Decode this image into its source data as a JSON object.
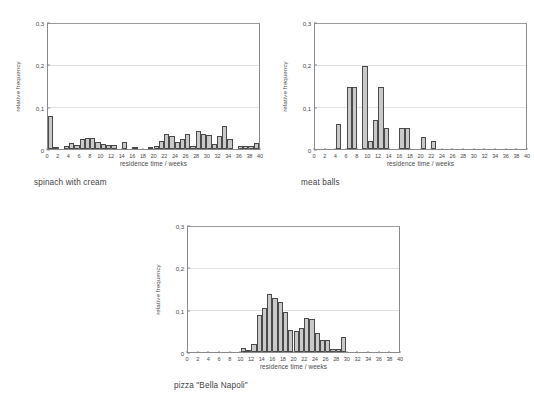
{
  "figure": {
    "background_color": "#ffffff",
    "bar_fill_color": "#c9c9c9",
    "bar_edge_color": "#4a4a4a",
    "axis_color": "#8a8a8a",
    "grid_color": "#e2e2e2",
    "text_color": "#3f3f3f"
  },
  "chart_data": [
    {
      "type": "bar",
      "id": "spinach-with-cream",
      "title": "spinach with cream",
      "caption": "spinach with cream",
      "xlabel": "residence time / weeks",
      "ylabel": "relative frequency",
      "xlim": [
        0,
        40
      ],
      "ylim": [
        0,
        0.3
      ],
      "bin_width": 1,
      "grid": true,
      "legend": "none",
      "ytick_labels": [
        "0",
        "0,1",
        "0,2",
        "0,3"
      ],
      "ytick_values": [
        0,
        0.1,
        0.2,
        0.3
      ],
      "xtick_labels": [
        "0",
        "2",
        "4",
        "6",
        "8",
        "10",
        "12",
        "14",
        "16",
        "18",
        "20",
        "22",
        "24",
        "26",
        "28",
        "30",
        "32",
        "34",
        "36",
        "38",
        "40"
      ],
      "xtick_values": [
        0,
        2,
        4,
        6,
        8,
        10,
        12,
        14,
        16,
        18,
        20,
        22,
        24,
        26,
        28,
        30,
        32,
        34,
        36,
        38,
        40
      ],
      "x": [
        0,
        1,
        2,
        3,
        4,
        5,
        6,
        7,
        8,
        9,
        10,
        11,
        12,
        13,
        14,
        15,
        16,
        17,
        18,
        19,
        20,
        21,
        22,
        23,
        24,
        25,
        26,
        27,
        28,
        29,
        30,
        31,
        32,
        33,
        34,
        35,
        36,
        37,
        38,
        39
      ],
      "values": [
        0.08,
        0.006,
        0.0,
        0.008,
        0.014,
        0.009,
        0.024,
        0.027,
        0.027,
        0.016,
        0.012,
        0.009,
        0.009,
        0.0,
        0.017,
        0.0,
        0.006,
        0.0,
        0.0,
        0.005,
        0.008,
        0.02,
        0.035,
        0.032,
        0.018,
        0.025,
        0.035,
        0.007,
        0.044,
        0.035,
        0.034,
        0.013,
        0.031,
        0.055,
        0.023,
        0.0,
        0.008,
        0.008,
        0.008,
        0.015
      ]
    },
    {
      "type": "bar",
      "id": "meat-balls",
      "title": "meat balls",
      "caption": "meat balls",
      "xlabel": "residence time / weeks",
      "ylabel": "relative frequency",
      "xlim": [
        0,
        40
      ],
      "ylim": [
        0,
        0.3
      ],
      "bin_width": 1,
      "grid": true,
      "legend": "none",
      "ytick_labels": [
        "0",
        "0,1",
        "0,2",
        "0,3"
      ],
      "ytick_values": [
        0,
        0.1,
        0.2,
        0.3
      ],
      "xtick_labels": [
        "0",
        "2",
        "4",
        "6",
        "8",
        "10",
        "12",
        "14",
        "16",
        "18",
        "20",
        "22",
        "24",
        "26",
        "28",
        "30",
        "32",
        "34",
        "36",
        "38",
        "40"
      ],
      "xtick_values": [
        0,
        2,
        4,
        6,
        8,
        10,
        12,
        14,
        16,
        18,
        20,
        22,
        24,
        26,
        28,
        30,
        32,
        34,
        36,
        38,
        40
      ],
      "x": [
        0,
        1,
        2,
        3,
        4,
        5,
        6,
        7,
        8,
        9,
        10,
        11,
        12,
        13,
        14,
        15,
        16,
        17,
        18,
        19,
        20,
        21,
        22,
        23,
        24,
        25,
        26,
        27,
        28,
        29,
        30,
        31,
        32,
        33,
        34,
        35,
        36,
        37,
        38,
        39
      ],
      "values": [
        0.0,
        0.0,
        0.0,
        0.0,
        0.06,
        0.0,
        0.15,
        0.15,
        0.0,
        0.2,
        0.02,
        0.07,
        0.15,
        0.05,
        0.0,
        0.0,
        0.05,
        0.05,
        0.0,
        0.0,
        0.03,
        0.0,
        0.02,
        0.0,
        0.0,
        0.0,
        0.0,
        0.0,
        0.0,
        0.0,
        0.0,
        0.0,
        0.0,
        0.0,
        0.0,
        0.0,
        0.0,
        0.0,
        0.0,
        0.0
      ]
    },
    {
      "type": "bar",
      "id": "pizza-bella-napoli",
      "title": "pizza \"Bella Napoli\"",
      "caption": "pizza \"Bella Napoli\"",
      "xlabel": "residence time / weeks",
      "ylabel": "relative frequency",
      "xlim": [
        0,
        40
      ],
      "ylim": [
        0,
        0.3
      ],
      "bin_width": 1,
      "grid": true,
      "legend": "none",
      "ytick_labels": [
        "0",
        "0,1",
        "0,2",
        "0,3"
      ],
      "ytick_values": [
        0,
        0.1,
        0.2,
        0.3
      ],
      "xtick_labels": [
        "0",
        "2",
        "4",
        "6",
        "8",
        "10",
        "12",
        "14",
        "16",
        "18",
        "20",
        "22",
        "24",
        "26",
        "28",
        "30",
        "32",
        "34",
        "36",
        "38",
        "40"
      ],
      "xtick_values": [
        0,
        2,
        4,
        6,
        8,
        10,
        12,
        14,
        16,
        18,
        20,
        22,
        24,
        26,
        28,
        30,
        32,
        34,
        36,
        38,
        40
      ],
      "x": [
        0,
        1,
        2,
        3,
        4,
        5,
        6,
        7,
        8,
        9,
        10,
        11,
        12,
        13,
        14,
        15,
        16,
        17,
        18,
        19,
        20,
        21,
        22,
        23,
        24,
        25,
        26,
        27,
        28,
        29,
        30,
        31,
        32,
        33,
        34,
        35,
        36,
        37,
        38,
        39
      ],
      "values": [
        0.0,
        0.0,
        0.0,
        0.0,
        0.0,
        0.0,
        0.0,
        0.0,
        0.0,
        0.0,
        0.01,
        0.006,
        0.02,
        0.09,
        0.105,
        0.14,
        0.13,
        0.12,
        0.095,
        0.052,
        0.05,
        0.058,
        0.082,
        0.08,
        0.045,
        0.03,
        0.028,
        0.008,
        0.008,
        0.035,
        0.0,
        0.0,
        0.0,
        0.0,
        0.0,
        0.0,
        0.0,
        0.0,
        0.0,
        0.0
      ]
    }
  ]
}
